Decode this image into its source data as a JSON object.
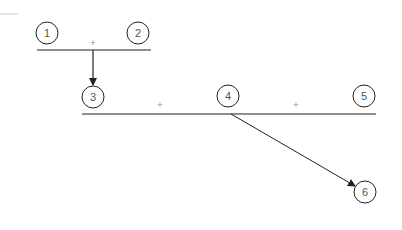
{
  "diagram": {
    "type": "tree-merge",
    "colors": {
      "stroke": "#222222",
      "text": "#555555",
      "plus": "#888888",
      "faint": "#cccccc"
    },
    "nodes": [
      {
        "id": "1",
        "label": "1",
        "cx": 47,
        "cy": 33
      },
      {
        "id": "2",
        "label": "2",
        "cx": 138,
        "cy": 33
      },
      {
        "id": "3",
        "label": "3",
        "cx": 93,
        "cy": 97
      },
      {
        "id": "4",
        "label": "4",
        "cx": 228,
        "cy": 96
      },
      {
        "id": "5",
        "label": "5",
        "cx": 364,
        "cy": 96
      },
      {
        "id": "6",
        "label": "6",
        "cx": 365,
        "cy": 192
      }
    ],
    "operators": [
      {
        "label": "+",
        "between": [
          "1",
          "2"
        ]
      },
      {
        "label": "+",
        "between": [
          "3",
          "4"
        ]
      },
      {
        "label": "+",
        "between": [
          "4",
          "5"
        ]
      }
    ],
    "edges": [
      {
        "from": "1+2",
        "to": "3"
      },
      {
        "from": "4",
        "to": "6"
      }
    ]
  }
}
